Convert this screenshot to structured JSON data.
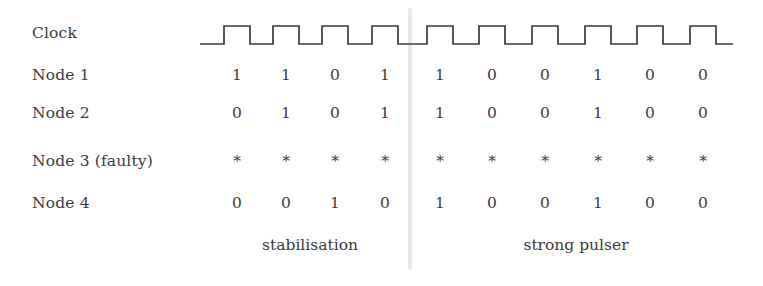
{
  "figure": {
    "type": "timing-diagram",
    "background_color": "#ffffff",
    "ink_color": "#3b3b3b",
    "divider_color": "#e9e9e9"
  },
  "rows": [
    {
      "label": "Clock",
      "kind": "waveform"
    },
    {
      "label": "Node 1",
      "kind": "values",
      "values": [
        "1",
        "1",
        "0",
        "1",
        "1",
        "0",
        "0",
        "1",
        "0",
        "0"
      ]
    },
    {
      "label": "Node 2",
      "kind": "values",
      "values": [
        "0",
        "1",
        "0",
        "1",
        "1",
        "0",
        "0",
        "1",
        "0",
        "0"
      ]
    },
    {
      "label": "Node 3 (faulty)",
      "kind": "values",
      "values": [
        "*",
        "*",
        "*",
        "*",
        "*",
        "*",
        "*",
        "*",
        "*",
        "*"
      ]
    },
    {
      "label": "Node 4",
      "kind": "values",
      "values": [
        "0",
        "0",
        "1",
        "0",
        "1",
        "0",
        "0",
        "1",
        "0",
        "0"
      ]
    }
  ],
  "phases": [
    {
      "label": "stabilisation",
      "tick_start": 1,
      "tick_end": 4
    },
    {
      "label": "strong pulser",
      "tick_start": 5,
      "tick_end": 10
    }
  ],
  "chart_data": {
    "type": "table",
    "title": "",
    "categories": [
      "1",
      "2",
      "3",
      "4",
      "5",
      "6",
      "7",
      "8",
      "9",
      "10"
    ],
    "series": [
      {
        "name": "Clock",
        "values": [
          "pulse",
          "pulse",
          "pulse",
          "pulse",
          "pulse",
          "pulse",
          "pulse",
          "pulse",
          "pulse",
          "pulse"
        ]
      },
      {
        "name": "Node 1",
        "values": [
          1,
          1,
          0,
          1,
          1,
          0,
          0,
          1,
          0,
          0
        ]
      },
      {
        "name": "Node 2",
        "values": [
          0,
          1,
          0,
          1,
          1,
          0,
          0,
          1,
          0,
          0
        ]
      },
      {
        "name": "Node 3 (faulty)",
        "values": [
          "*",
          "*",
          "*",
          "*",
          "*",
          "*",
          "*",
          "*",
          "*",
          "*"
        ]
      },
      {
        "name": "Node 4",
        "values": [
          0,
          0,
          1,
          0,
          1,
          0,
          0,
          1,
          0,
          0
        ]
      }
    ],
    "annotations": [
      "stabilisation",
      "strong pulser"
    ],
    "xlabel": "",
    "ylabel": "",
    "grid": false,
    "legend": "none"
  },
  "geometry": {
    "column_centers": [
      237,
      286,
      335,
      385,
      440,
      492,
      545,
      598,
      650,
      703
    ],
    "row_tops": [
      26,
      68,
      106,
      154,
      196
    ],
    "divider_x": 409,
    "wave_baseline_y": 24,
    "wave_high_y": 6,
    "phase_caption_centers": [
      310,
      576
    ]
  }
}
